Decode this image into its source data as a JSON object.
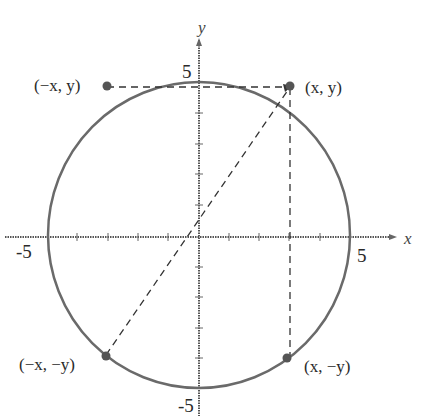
{
  "diagram": {
    "type": "unit-circle-symmetry",
    "axes": {
      "x_label": "x",
      "y_label": "y",
      "x_ticks": {
        "min": "-5",
        "max": "5"
      },
      "y_ticks": {
        "min": "-5",
        "max": "5"
      }
    },
    "points": [
      {
        "label": "(x, y)"
      },
      {
        "label": "(−x, y)"
      },
      {
        "label": "(−x, −y)"
      },
      {
        "label": "(x, −y)"
      }
    ],
    "colors": {
      "circle": "#6a6a6a",
      "points": "#555555",
      "dashed": "#333333",
      "axes": "#555555"
    }
  }
}
